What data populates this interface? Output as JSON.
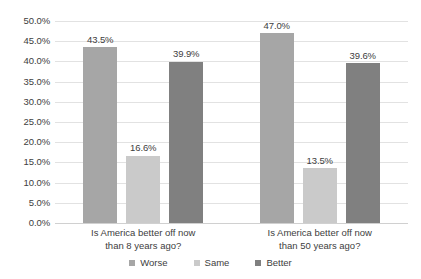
{
  "chart_data": {
    "type": "bar",
    "title": "",
    "subtitle": "",
    "xlabel": "",
    "ylabel": "",
    "ylim": [
      0,
      50
    ],
    "ytick_step": 5,
    "ytick_labels": [
      "0.0%",
      "5.0%",
      "10.0%",
      "15.0%",
      "20.0%",
      "25.0%",
      "30.0%",
      "35.0%",
      "40.0%",
      "45.0%",
      "50.0%"
    ],
    "grid": true,
    "legend_position": "bottom",
    "categories": [
      "Is America better off now than 8 years ago?",
      "Is America better off now than 50 years ago?"
    ],
    "category_lines": [
      [
        "Is America better off now",
        "than 8 years ago?"
      ],
      [
        "Is America better off now",
        "than 50 years ago?"
      ]
    ],
    "series": [
      {
        "name": "Worse",
        "color": "#a6a6a6",
        "values": [
          43.5,
          47.0
        ],
        "labels": [
          "43.5%",
          "47.0%"
        ]
      },
      {
        "name": "Same",
        "color": "#cacaca",
        "values": [
          16.6,
          13.5
        ],
        "labels": [
          "16.6%",
          "13.5%"
        ]
      },
      {
        "name": "Better",
        "color": "#808080",
        "values": [
          39.9,
          39.6
        ],
        "labels": [
          "39.9%",
          "39.6%"
        ]
      }
    ]
  },
  "colors": {
    "background": "#ffffff",
    "gridline": "#e2e2e2",
    "baseline": "#d0d0d0",
    "text": "#404040",
    "worse": "#a6a6a6",
    "same": "#cacaca",
    "better": "#808080"
  }
}
